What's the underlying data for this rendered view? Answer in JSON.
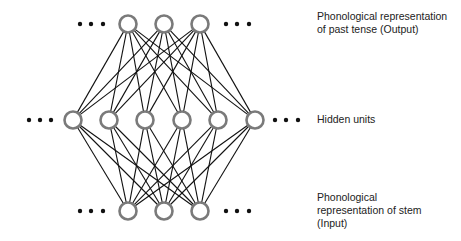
{
  "diagram": {
    "type": "neural-network",
    "layers": [
      {
        "name": "output",
        "label": "Phonological representation\nof past tense (Output)",
        "y": 24,
        "nodes_x": [
          128,
          164,
          200
        ],
        "ellipsis_left_x": [
          80,
          91,
          103
        ],
        "ellipsis_right_x": [
          226,
          237,
          249
        ]
      },
      {
        "name": "hidden",
        "label": "Hidden units",
        "y": 120,
        "nodes_x": [
          73,
          109,
          145,
          182,
          218,
          255
        ],
        "ellipsis_left_x": [
          29,
          40,
          51
        ],
        "ellipsis_right_x": [
          275,
          286,
          298
        ]
      },
      {
        "name": "input",
        "label": "Phonological\nrepresentation of stem\n(Input)",
        "y": 211,
        "nodes_x": [
          128,
          164,
          200
        ],
        "ellipsis_left_x": [
          80,
          91,
          103
        ],
        "ellipsis_right_x": [
          226,
          237,
          249
        ]
      }
    ],
    "connections": "fully-connected between adjacent layers",
    "colors": {
      "node_stroke": "#7a7a7a",
      "edge": "#111111",
      "dot": "#111111",
      "text": "#222222"
    },
    "node_radius": 8.5
  }
}
